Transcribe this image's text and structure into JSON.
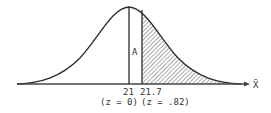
{
  "figure": {
    "type": "normal-distribution-curve",
    "mean_label": "21",
    "value_label": "21.7",
    "mean_z_label": "(z = 0)",
    "value_z_label": "(z = .82)",
    "area_label": "A",
    "axis_label": "X̄",
    "shaded_region": "right tail beyond 21.7",
    "colors": {
      "line": "#2a2a2a",
      "hatch": "#555555",
      "background": "#ffffff"
    }
  }
}
